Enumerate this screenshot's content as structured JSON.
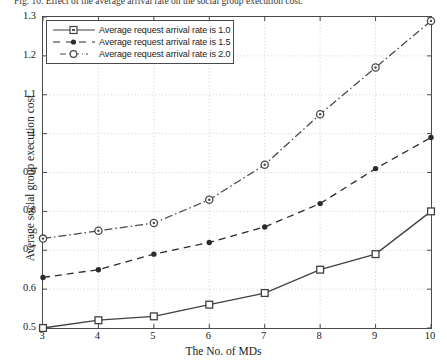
{
  "caption": "Fig. 10.  Effect of the average arrival rate on the social group execution cost.",
  "axes": {
    "xlabel": "The No. of MDs",
    "ylabel": "Average social group execution cost",
    "xticks": [
      "3",
      "4",
      "5",
      "6",
      "7",
      "8",
      "9",
      "10"
    ],
    "yticks": [
      "0.5",
      "0.6",
      "0.7",
      "0.8",
      "0.9",
      "1",
      "1.1",
      "1.2",
      "1.3"
    ]
  },
  "legend": {
    "items": [
      {
        "label": "Average request arrival rate is 1.0",
        "marker": "square",
        "line": "solid"
      },
      {
        "label": "Average request arrival rate is 1.5",
        "marker": "dot",
        "line": "dashed"
      },
      {
        "label": "Average request arrival rate is 2.0",
        "marker": "circle",
        "line": "dashdot"
      }
    ]
  },
  "chart_data": {
    "type": "line",
    "title": "",
    "xlabel": "The No. of MDs",
    "ylabel": "Average social group execution cost",
    "x": [
      3,
      4,
      5,
      6,
      7,
      8,
      9,
      10
    ],
    "xlim": [
      3,
      10
    ],
    "ylim": [
      0.5,
      1.3
    ],
    "grid": true,
    "legend_position": "upper left",
    "series": [
      {
        "name": "Average request arrival rate is 1.0",
        "marker": "square",
        "line": "solid",
        "color": "#404040",
        "values": [
          0.5,
          0.52,
          0.53,
          0.56,
          0.59,
          0.65,
          0.69,
          0.8
        ]
      },
      {
        "name": "Average request arrival rate is 1.5",
        "marker": "dot",
        "line": "dashed",
        "color": "#2b2b2b",
        "values": [
          0.63,
          0.65,
          0.69,
          0.72,
          0.76,
          0.82,
          0.91,
          0.99
        ]
      },
      {
        "name": "Average request arrival rate is 2.0",
        "marker": "circle",
        "line": "dashdot",
        "color": "#4a4a4a",
        "values": [
          0.73,
          0.75,
          0.77,
          0.83,
          0.92,
          1.05,
          1.17,
          1.29
        ]
      }
    ]
  },
  "colors": {
    "axis": "#4a4a4a",
    "grid": "#c8c8c8",
    "series1": "#404040",
    "series2": "#2b2b2b",
    "series3": "#4a4a4a"
  }
}
